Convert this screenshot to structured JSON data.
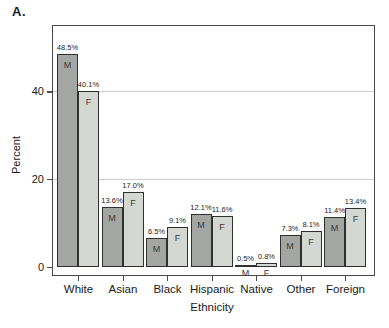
{
  "panel_label": "A.",
  "chart_data": {
    "type": "bar",
    "title": "A.",
    "xlabel": "Ethnicity",
    "ylabel": "Percent",
    "ylim": [
      0,
      56.5
    ],
    "y_ticks": [
      "0",
      "20",
      "40"
    ],
    "y_tick_values": [
      0,
      20,
      40
    ],
    "gridlines": [
      20,
      40
    ],
    "grid_on": true,
    "legend_position": "none",
    "categories": [
      "White",
      "Asian",
      "Black",
      "Hispanic",
      "Native",
      "Other",
      "Foreign"
    ],
    "series": [
      {
        "name": "M",
        "color": "#a3a6a2",
        "values": [
          48.5,
          13.6,
          6.5,
          12.1,
          0.5,
          7.3,
          11.4
        ],
        "labels": [
          "48.5%",
          "13.6%",
          "6.5%",
          "12.1%",
          "0.5%",
          "7.3%",
          "11.4%"
        ]
      },
      {
        "name": "F",
        "color": "#d5d7d2",
        "values": [
          40.1,
          17.0,
          9.1,
          11.6,
          0.8,
          8.1,
          13.4
        ],
        "labels": [
          "40.1%",
          "17.0%",
          "9.1%",
          "11.6%",
          "0.8%",
          "8.1%",
          "13.4%"
        ]
      }
    ],
    "colors": {
      "frame": "#4a4a4a",
      "bar_border": "#303030",
      "gridline": "#cdcdcd",
      "text": "#1a1a1a"
    }
  }
}
